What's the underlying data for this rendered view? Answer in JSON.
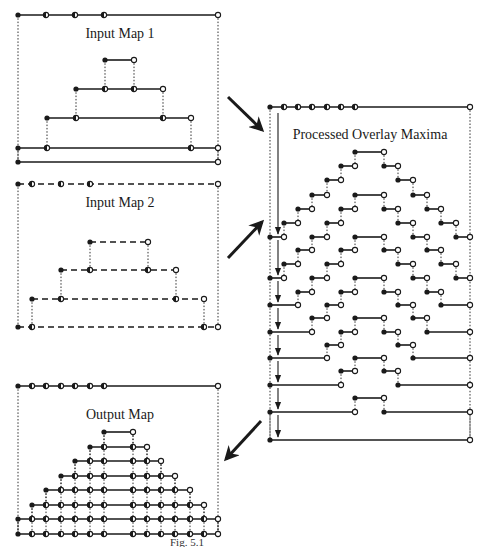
{
  "figure": {
    "caption": "Fig. 5.1",
    "colors": {
      "ink": "#1a1a1a",
      "background": "#ffffff"
    },
    "panels": [
      {
        "id": "input-map-1",
        "title": "Input Map 1",
        "box": {
          "x0": 18,
          "x1": 218,
          "y0": 15,
          "y1": 162
        },
        "title_pos": {
          "x": 120,
          "y": 38
        },
        "line_style": "solid",
        "top_points": [
          [
            18,
            "filled"
          ],
          [
            46,
            "half"
          ],
          [
            75,
            "half"
          ],
          [
            104,
            "half"
          ],
          [
            218,
            "open"
          ]
        ],
        "levels": [
          {
            "y": 60,
            "x0": 105,
            "x1": 134,
            "pts": [
              [
                105,
                "filled"
              ],
              [
                134,
                "open"
              ]
            ]
          },
          {
            "y": 89,
            "x0": 76,
            "x1": 163,
            "pts": [
              [
                76,
                "filled"
              ],
              [
                105,
                "half"
              ],
              [
                134,
                "half"
              ],
              [
                163,
                "open"
              ]
            ]
          },
          {
            "y": 118,
            "x0": 47,
            "x1": 191,
            "pts": [
              [
                47,
                "filled"
              ],
              [
                76,
                "half"
              ],
              [
                163,
                "half"
              ],
              [
                191,
                "open"
              ]
            ]
          },
          {
            "y": 148,
            "x0": 18,
            "x1": 218,
            "pts": [
              [
                18,
                "filled"
              ],
              [
                47,
                "half"
              ],
              [
                191,
                "half"
              ],
              [
                218,
                "open"
              ]
            ]
          },
          {
            "y": 162,
            "x0": 18,
            "x1": 218,
            "pts": [
              [
                18,
                "filled"
              ],
              [
                218,
                "open"
              ]
            ]
          }
        ],
        "connectors": [
          [
            105,
            60,
            89
          ],
          [
            134,
            60,
            89
          ],
          [
            76,
            89,
            118
          ],
          [
            163,
            89,
            118
          ],
          [
            47,
            118,
            148
          ],
          [
            191,
            118,
            148
          ],
          [
            18,
            148,
            162
          ],
          [
            218,
            148,
            162
          ]
        ]
      },
      {
        "id": "input-map-2",
        "title": "Input Map 2",
        "box": {
          "x0": 18,
          "x1": 218,
          "y0": 184,
          "y1": 327
        },
        "title_pos": {
          "x": 120,
          "y": 207
        },
        "line_style": "dashed",
        "top_points": [
          [
            18,
            "filled"
          ],
          [
            32,
            "half"
          ],
          [
            61,
            "half"
          ],
          [
            90,
            "half"
          ],
          [
            218,
            "open"
          ]
        ],
        "levels": [
          {
            "y": 242,
            "x0": 90,
            "x1": 148,
            "pts": [
              [
                90,
                "filled"
              ],
              [
                148,
                "open"
              ]
            ]
          },
          {
            "y": 270,
            "x0": 61,
            "x1": 176,
            "pts": [
              [
                61,
                "filled"
              ],
              [
                90,
                "half"
              ],
              [
                148,
                "half"
              ],
              [
                176,
                "open"
              ]
            ]
          },
          {
            "y": 299,
            "x0": 32,
            "x1": 204,
            "pts": [
              [
                32,
                "filled"
              ],
              [
                61,
                "half"
              ],
              [
                176,
                "half"
              ],
              [
                204,
                "open"
              ]
            ]
          },
          {
            "y": 327,
            "x0": 18,
            "x1": 218,
            "pts": [
              [
                18,
                "filled"
              ],
              [
                32,
                "half"
              ],
              [
                204,
                "half"
              ],
              [
                218,
                "open"
              ]
            ]
          }
        ],
        "connectors": [
          [
            90,
            242,
            270
          ],
          [
            148,
            242,
            270
          ],
          [
            61,
            270,
            299
          ],
          [
            176,
            270,
            299
          ],
          [
            32,
            299,
            327
          ],
          [
            204,
            299,
            327
          ]
        ]
      },
      {
        "id": "processed-overlay-maxima",
        "title": "Processed Overlay Maxima",
        "box": {
          "x0": 270,
          "x1": 470,
          "y0": 107,
          "y1": 440
        },
        "title_pos": {
          "x": 370,
          "y": 139
        },
        "line_style": "solid",
        "top_points": [
          [
            270,
            "filled"
          ],
          [
            284,
            "half"
          ],
          [
            298,
            "half"
          ],
          [
            312,
            "half"
          ],
          [
            327,
            "half"
          ],
          [
            341,
            "half"
          ],
          [
            355,
            "half"
          ],
          [
            470,
            "open"
          ]
        ],
        "segments": [
          [
            355,
            384,
            152
          ],
          [
            341,
            355,
            166
          ],
          [
            384,
            398,
            166
          ],
          [
            327,
            341,
            180
          ],
          [
            398,
            413,
            180
          ],
          [
            312,
            327,
            195
          ],
          [
            355,
            384,
            195
          ],
          [
            413,
            427,
            195
          ],
          [
            298,
            312,
            209
          ],
          [
            341,
            355,
            209
          ],
          [
            384,
            398,
            209
          ],
          [
            427,
            441,
            209
          ],
          [
            284,
            298,
            223
          ],
          [
            327,
            341,
            223
          ],
          [
            398,
            413,
            223
          ],
          [
            441,
            456,
            223
          ],
          [
            270,
            284,
            237
          ],
          [
            312,
            327,
            237
          ],
          [
            355,
            384,
            237
          ],
          [
            413,
            427,
            237
          ],
          [
            456,
            470,
            237
          ],
          [
            298,
            312,
            250
          ],
          [
            341,
            355,
            250
          ],
          [
            384,
            398,
            250
          ],
          [
            427,
            441,
            250
          ],
          [
            284,
            298,
            264
          ],
          [
            327,
            341,
            264
          ],
          [
            398,
            413,
            264
          ],
          [
            441,
            456,
            264
          ],
          [
            270,
            284,
            278
          ],
          [
            312,
            327,
            278
          ],
          [
            355,
            384,
            278
          ],
          [
            413,
            427,
            278
          ],
          [
            456,
            470,
            278
          ],
          [
            298,
            312,
            292
          ],
          [
            341,
            355,
            292
          ],
          [
            384,
            398,
            292
          ],
          [
            427,
            441,
            292
          ],
          [
            270,
            298,
            305
          ],
          [
            327,
            341,
            305
          ],
          [
            398,
            413,
            305
          ],
          [
            441,
            470,
            305
          ],
          [
            312,
            327,
            318
          ],
          [
            355,
            384,
            318
          ],
          [
            413,
            427,
            318
          ],
          [
            270,
            312,
            332
          ],
          [
            341,
            355,
            332
          ],
          [
            384,
            398,
            332
          ],
          [
            427,
            470,
            332
          ],
          [
            327,
            341,
            345
          ],
          [
            398,
            413,
            345
          ],
          [
            270,
            327,
            358
          ],
          [
            355,
            384,
            358
          ],
          [
            413,
            470,
            358
          ],
          [
            341,
            355,
            371
          ],
          [
            384,
            398,
            371
          ],
          [
            270,
            341,
            385
          ],
          [
            398,
            470,
            385
          ],
          [
            355,
            384,
            398
          ],
          [
            270,
            355,
            412
          ],
          [
            384,
            470,
            412
          ],
          [
            270,
            470,
            440
          ]
        ],
        "arrow_x": 278,
        "arrow_rows": [
          107,
          237,
          278,
          305,
          332,
          358,
          385,
          412,
          440
        ]
      },
      {
        "id": "output-map",
        "title": "Output Map",
        "box": {
          "x0": 18,
          "x1": 218,
          "y0": 386,
          "y1": 534
        },
        "title_pos": {
          "x": 120,
          "y": 419
        },
        "line_style": "solid",
        "top_points": [
          [
            18,
            "filled"
          ],
          [
            32,
            "half"
          ],
          [
            46,
            "half"
          ],
          [
            61,
            "half"
          ],
          [
            75,
            "half"
          ],
          [
            90,
            "half"
          ],
          [
            104,
            "half"
          ],
          [
            218,
            "open"
          ]
        ],
        "levels": [
          {
            "y": 432,
            "x0": 104,
            "x1": 133,
            "pts": [
              [
                104,
                "filled"
              ],
              [
                133,
                "open"
              ]
            ]
          },
          {
            "y": 447,
            "x0": 90,
            "x1": 147,
            "pts": [
              [
                90,
                "filled"
              ],
              [
                104,
                "half"
              ],
              [
                133,
                "half"
              ],
              [
                147,
                "open"
              ]
            ]
          },
          {
            "y": 461,
            "x0": 75,
            "x1": 161,
            "pts": [
              [
                75,
                "filled"
              ],
              [
                90,
                "half"
              ],
              [
                104,
                "half"
              ],
              [
                133,
                "half"
              ],
              [
                147,
                "half"
              ],
              [
                161,
                "open"
              ]
            ]
          },
          {
            "y": 476,
            "x0": 61,
            "x1": 175,
            "pts": [
              [
                61,
                "filled"
              ],
              [
                75,
                "half"
              ],
              [
                90,
                "half"
              ],
              [
                104,
                "half"
              ],
              [
                133,
                "half"
              ],
              [
                147,
                "half"
              ],
              [
                161,
                "half"
              ],
              [
                175,
                "open"
              ]
            ]
          },
          {
            "y": 490,
            "x0": 46,
            "x1": 190,
            "pts": [
              [
                46,
                "filled"
              ],
              [
                61,
                "half"
              ],
              [
                75,
                "half"
              ],
              [
                90,
                "half"
              ],
              [
                104,
                "half"
              ],
              [
                133,
                "half"
              ],
              [
                147,
                "half"
              ],
              [
                161,
                "half"
              ],
              [
                175,
                "half"
              ],
              [
                190,
                "open"
              ]
            ]
          },
          {
            "y": 505,
            "x0": 32,
            "x1": 204,
            "pts": [
              [
                32,
                "filled"
              ],
              [
                46,
                "half"
              ],
              [
                61,
                "half"
              ],
              [
                75,
                "half"
              ],
              [
                90,
                "half"
              ],
              [
                104,
                "half"
              ],
              [
                133,
                "half"
              ],
              [
                147,
                "half"
              ],
              [
                161,
                "half"
              ],
              [
                175,
                "half"
              ],
              [
                190,
                "half"
              ],
              [
                204,
                "open"
              ]
            ]
          },
          {
            "y": 519,
            "x0": 18,
            "x1": 218,
            "pts": [
              [
                18,
                "filled"
              ],
              [
                32,
                "half"
              ],
              [
                46,
                "half"
              ],
              [
                61,
                "half"
              ],
              [
                75,
                "half"
              ],
              [
                90,
                "half"
              ],
              [
                104,
                "half"
              ],
              [
                133,
                "half"
              ],
              [
                147,
                "half"
              ],
              [
                161,
                "half"
              ],
              [
                175,
                "half"
              ],
              [
                190,
                "half"
              ],
              [
                204,
                "half"
              ],
              [
                218,
                "open"
              ]
            ]
          },
          {
            "y": 534,
            "x0": 18,
            "x1": 218,
            "pts": [
              [
                18,
                "filled"
              ],
              [
                32,
                "half"
              ],
              [
                46,
                "half"
              ],
              [
                61,
                "half"
              ],
              [
                75,
                "half"
              ],
              [
                90,
                "half"
              ],
              [
                104,
                "half"
              ],
              [
                133,
                "half"
              ],
              [
                147,
                "half"
              ],
              [
                161,
                "half"
              ],
              [
                175,
                "half"
              ],
              [
                190,
                "half"
              ],
              [
                204,
                "half"
              ],
              [
                218,
                "open"
              ]
            ]
          }
        ]
      }
    ],
    "arrows": [
      {
        "id": "map1-to-processed",
        "x1": 228,
        "y1": 97,
        "x2": 262,
        "y2": 130
      },
      {
        "id": "map2-to-processed",
        "x1": 228,
        "y1": 258,
        "x2": 262,
        "y2": 222
      },
      {
        "id": "processed-to-output",
        "x1": 261,
        "y1": 421,
        "x2": 226,
        "y2": 459
      }
    ]
  }
}
